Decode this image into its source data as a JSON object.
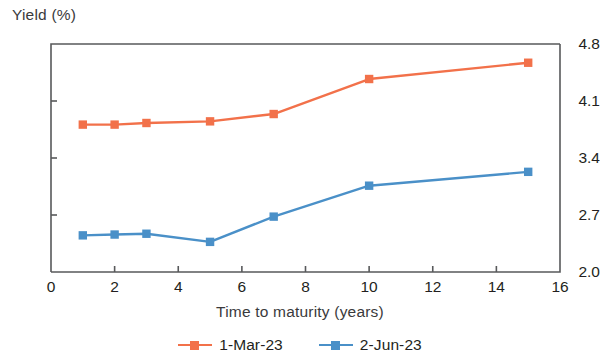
{
  "chart_data": {
    "type": "line",
    "title": "",
    "xlabel": "Time to maturity (years)",
    "ylabel": "Yield (%)",
    "xlim": [
      0,
      16
    ],
    "ylim": [
      2.0,
      4.8
    ],
    "xticks": [
      "0",
      "2",
      "4",
      "6",
      "8",
      "10",
      "12",
      "14",
      "16"
    ],
    "yticks": [
      "2.0",
      "2.7",
      "3.4",
      "4.1",
      "4.8"
    ],
    "grid": false,
    "legend_position": "bottom-center",
    "x": [
      1,
      2,
      3,
      5,
      7,
      10,
      15
    ],
    "series": [
      {
        "name": "1-Mar-23",
        "color": "#F2714A",
        "values": [
          3.81,
          3.81,
          3.83,
          3.85,
          3.94,
          4.37,
          4.57
        ]
      },
      {
        "name": "2-Jun-23",
        "color": "#4A90C8",
        "values": [
          2.45,
          2.46,
          2.47,
          2.37,
          2.68,
          3.06,
          3.23
        ]
      }
    ]
  },
  "legend": {
    "items": [
      {
        "label": "1-Mar-23",
        "marker": "square-marker"
      },
      {
        "label": "2-Jun-23",
        "marker": "square-marker"
      }
    ]
  },
  "axes": {
    "axis_color": "#58595B",
    "text_color": "#231f20"
  }
}
